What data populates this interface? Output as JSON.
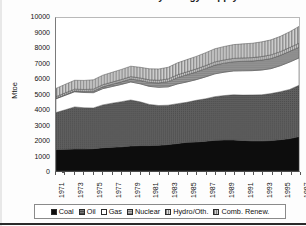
{
  "chart_data": {
    "type": "area",
    "stacked": true,
    "title": "World Total Primary Energy Supply",
    "xlabel": "",
    "ylabel": "Mtoe",
    "ylim": [
      0,
      10000
    ],
    "ytick_step": 1000,
    "yticks": [
      "10000",
      "9000",
      "8000",
      "7000",
      "6000",
      "5000",
      "4000",
      "3000",
      "2000",
      "1000",
      "0"
    ],
    "grid": false,
    "legend_position": "bottom",
    "x": [
      1971,
      1972,
      1973,
      1974,
      1975,
      1976,
      1977,
      1978,
      1979,
      1980,
      1981,
      1982,
      1983,
      1984,
      1985,
      1986,
      1987,
      1988,
      1989,
      1990,
      1991,
      1992,
      1993,
      1994,
      1995,
      1996,
      1997
    ],
    "xtick_labels": [
      "1971",
      "1973",
      "1975",
      "1977",
      "1979",
      "1981",
      "1983",
      "1985",
      "1987",
      "1989",
      "1991",
      "1993",
      "1995",
      "1997"
    ],
    "series": [
      {
        "name": "Coal",
        "color": "#0d0d0d",
        "pattern": "solid",
        "values": [
          1400,
          1420,
          1440,
          1440,
          1460,
          1520,
          1560,
          1580,
          1640,
          1660,
          1660,
          1680,
          1730,
          1800,
          1880,
          1900,
          1950,
          2010,
          2030,
          2030,
          2000,
          1970,
          1970,
          1990,
          2050,
          2120,
          2250
        ]
      },
      {
        "name": "Oil",
        "color": "#585858",
        "pattern": "fine-dot",
        "values": [
          2420,
          2580,
          2750,
          2690,
          2660,
          2800,
          2870,
          2950,
          3000,
          2860,
          2690,
          2600,
          2570,
          2600,
          2610,
          2720,
          2770,
          2850,
          2900,
          2950,
          2960,
          3000,
          3010,
          3070,
          3130,
          3210,
          3350
        ]
      },
      {
        "name": "Gas",
        "color": "#ffffff",
        "pattern": "none",
        "values": [
          900,
          950,
          990,
          1000,
          1000,
          1060,
          1090,
          1130,
          1180,
          1180,
          1180,
          1190,
          1200,
          1290,
          1330,
          1350,
          1430,
          1490,
          1530,
          1560,
          1590,
          1590,
          1620,
          1630,
          1700,
          1790,
          1790
        ]
      },
      {
        "name": "Nuclear",
        "color": "#8c8c8c",
        "pattern": "fine-grid",
        "values": [
          30,
          40,
          50,
          70,
          100,
          120,
          150,
          170,
          190,
          220,
          260,
          290,
          340,
          410,
          470,
          500,
          540,
          570,
          590,
          600,
          620,
          630,
          650,
          660,
          680,
          700,
          700
        ]
      },
      {
        "name": "Hydro/Oth.",
        "color": "#a8a8a8",
        "pattern": "vertical-line",
        "values": [
          110,
          120,
          120,
          130,
          130,
          140,
          140,
          150,
          160,
          160,
          170,
          170,
          180,
          190,
          190,
          200,
          200,
          210,
          210,
          220,
          220,
          220,
          230,
          240,
          240,
          250,
          260
        ]
      },
      {
        "name": "Comb. Renew.",
        "color": "#9a9a9a",
        "pattern": "hatch-vertical",
        "values": [
          540,
          560,
          580,
          590,
          610,
          620,
          640,
          660,
          680,
          700,
          720,
          740,
          760,
          780,
          800,
          820,
          840,
          860,
          880,
          900,
          920,
          940,
          960,
          980,
          1000,
          1030,
          1100
        ]
      }
    ],
    "totals": [
      5400,
      5670,
      5930,
      5920,
      5960,
      6260,
      6450,
      6640,
      6850,
      6780,
      6680,
      6670,
      6780,
      7070,
      7280,
      7490,
      7730,
      7990,
      8140,
      8260,
      8310,
      8350,
      8440,
      8570,
      8800,
      9100,
      9450
    ]
  },
  "legend": {
    "items": [
      {
        "label": "Coal",
        "swatch": "coal-swatch"
      },
      {
        "label": "Oil",
        "swatch": "oil-swatch"
      },
      {
        "label": "Gas",
        "swatch": "gas-swatch"
      },
      {
        "label": "Nuclear",
        "swatch": "nuclear-swatch"
      },
      {
        "label": "Hydro/Oth.",
        "swatch": "hydro-swatch"
      },
      {
        "label": "Comb. Renew.",
        "swatch": "comb-renew-swatch"
      }
    ]
  }
}
